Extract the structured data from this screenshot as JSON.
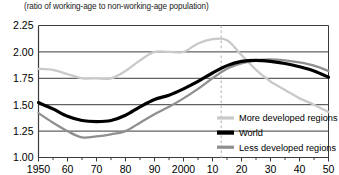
{
  "subtitle": "(ratio of working-age to non-working-age population)",
  "legend": {
    "items": [
      {
        "label": "More developed regions",
        "color": "#c9c9c9",
        "width": 3.2
      },
      {
        "label": "World",
        "color": "#000000",
        "width": 4.2
      },
      {
        "label": "Less developed regions",
        "color": "#8f8f8f",
        "width": 3.2
      }
    ]
  },
  "axes": {
    "y_ticks": [
      "1.00",
      "1.25",
      "1.50",
      "1.75",
      "2.00",
      "2.25"
    ],
    "x_ticks": [
      "1950",
      "60",
      "70",
      "80",
      "90",
      "2000",
      "10",
      "20",
      "30",
      "40",
      "50"
    ]
  },
  "annotations": {
    "projection_divider_year": 2013,
    "projection_divider_style": "dashed"
  },
  "chart_data": {
    "type": "line",
    "title": "",
    "subtitle": "(ratio of working-age to non-working-age population)",
    "xlabel": "",
    "ylabel": "",
    "xlim": [
      1950,
      2050
    ],
    "ylim": [
      1.0,
      2.25
    ],
    "ytick_step": 0.25,
    "xtick_step": 5,
    "xtick_major_step": 10,
    "grid": "horizontal",
    "legend_position": "inside-right-lower",
    "x": [
      1950,
      1955,
      1960,
      1965,
      1970,
      1975,
      1980,
      1985,
      1990,
      1995,
      2000,
      2005,
      2010,
      2015,
      2020,
      2025,
      2030,
      2035,
      2040,
      2045,
      2050
    ],
    "series": [
      {
        "name": "More developed regions",
        "color": "#c9c9c9",
        "values": [
          1.84,
          1.83,
          1.79,
          1.75,
          1.75,
          1.75,
          1.82,
          1.92,
          2.0,
          2.0,
          2.0,
          2.08,
          2.12,
          2.11,
          1.97,
          1.83,
          1.72,
          1.64,
          1.56,
          1.5,
          1.43
        ]
      },
      {
        "name": "World",
        "color": "#000000",
        "values": [
          1.52,
          1.46,
          1.39,
          1.35,
          1.34,
          1.35,
          1.4,
          1.48,
          1.55,
          1.59,
          1.65,
          1.72,
          1.8,
          1.87,
          1.91,
          1.92,
          1.91,
          1.89,
          1.86,
          1.82,
          1.76
        ]
      },
      {
        "name": "Less developed regions",
        "color": "#8f8f8f",
        "values": [
          1.42,
          1.33,
          1.25,
          1.19,
          1.2,
          1.22,
          1.25,
          1.33,
          1.41,
          1.48,
          1.56,
          1.65,
          1.75,
          1.84,
          1.89,
          1.92,
          1.93,
          1.92,
          1.9,
          1.87,
          1.82
        ]
      }
    ],
    "annotations": [
      {
        "type": "vline",
        "x": 2013,
        "style": "dashed",
        "color": "#b0b0b0"
      }
    ]
  }
}
